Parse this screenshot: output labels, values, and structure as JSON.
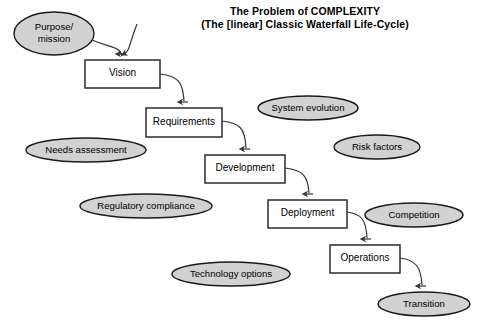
{
  "title": {
    "line1": "The Problem of COMPLEXITY",
    "line2": "(The [linear] Classic Waterfall Life-Cycle)"
  },
  "colors": {
    "background": "#ffffff",
    "ellipse_fill": "#d2d2d2",
    "ellipse_stroke": "#1a1a1a",
    "box_fill": "#ffffff",
    "box_stroke": "#2b2b2b",
    "arrow_stroke": "#333333",
    "text": "#000000"
  },
  "diagram": {
    "type": "flowchart",
    "process_nodes": [
      {
        "id": "vision",
        "label": "Vision",
        "shape": "rectangle",
        "x": 85,
        "y": 60,
        "w": 75,
        "h": 28
      },
      {
        "id": "requirements",
        "label": "Requirements",
        "shape": "rectangle",
        "x": 146,
        "y": 108,
        "w": 76,
        "h": 29
      },
      {
        "id": "development",
        "label": "Development",
        "shape": "rectangle",
        "x": 205,
        "y": 155,
        "w": 80,
        "h": 28
      },
      {
        "id": "deployment",
        "label": "Deployment",
        "shape": "rectangle",
        "x": 268,
        "y": 200,
        "w": 79,
        "h": 28
      },
      {
        "id": "operations",
        "label": "Operations",
        "shape": "rectangle",
        "x": 330,
        "y": 245,
        "w": 70,
        "h": 28
      }
    ],
    "ellipse_nodes": [
      {
        "id": "purpose-mission",
        "label": "Purpose/\nmission",
        "shape": "ellipse",
        "cx": 54,
        "cy": 33.5,
        "rx": 40,
        "ry": 21.5
      },
      {
        "id": "system-evolution",
        "label": "System evolution",
        "shape": "ellipse",
        "cx": 308,
        "cy": 108,
        "rx": 50,
        "ry": 12
      },
      {
        "id": "needs-assessment",
        "label": "Needs assessment",
        "shape": "ellipse",
        "cx": 86,
        "cy": 150,
        "rx": 60,
        "ry": 12
      },
      {
        "id": "risk-factors",
        "label": "Risk factors",
        "shape": "ellipse",
        "cx": 377,
        "cy": 147,
        "rx": 43,
        "ry": 12
      },
      {
        "id": "regulatory-compliance",
        "label": "Regulatory compliance",
        "shape": "ellipse",
        "cx": 146,
        "cy": 206,
        "rx": 66,
        "ry": 12
      },
      {
        "id": "competition",
        "label": "Competition",
        "shape": "ellipse",
        "cx": 414,
        "cy": 215,
        "rx": 49,
        "ry": 12
      },
      {
        "id": "technology-options",
        "label": "Technology options",
        "shape": "ellipse",
        "cx": 231,
        "cy": 274,
        "rx": 59,
        "ry": 12
      },
      {
        "id": "transition",
        "label": "Transition",
        "shape": "ellipse",
        "cx": 424,
        "cy": 304,
        "rx": 46,
        "ry": 12
      }
    ],
    "connections": [
      {
        "id": "purpose-to-vision",
        "from": "purpose-mission",
        "to": "vision",
        "style": "curved-arrow"
      },
      {
        "id": "vision-to-requirements",
        "from": "vision",
        "to": "requirements",
        "style": "curved-arrow"
      },
      {
        "id": "requirements-to-development",
        "from": "requirements",
        "to": "development",
        "style": "curved-arrow"
      },
      {
        "id": "development-to-deployment",
        "from": "development",
        "to": "deployment",
        "style": "curved-arrow"
      },
      {
        "id": "deployment-to-operations",
        "from": "deployment",
        "to": "operations",
        "style": "curved-arrow"
      },
      {
        "id": "operations-to-transition",
        "from": "operations",
        "to": "transition",
        "style": "curved-arrow"
      }
    ]
  }
}
